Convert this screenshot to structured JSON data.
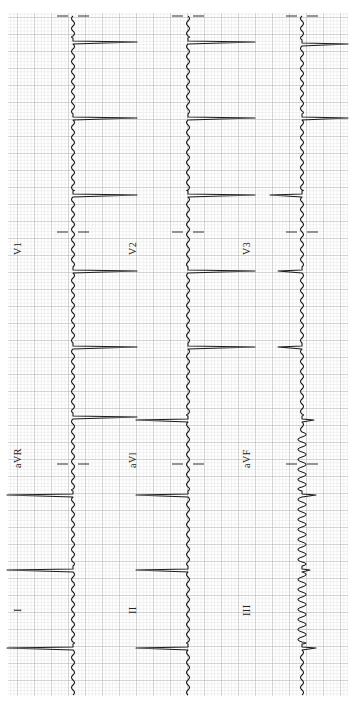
{
  "chart_data": {
    "type": "line",
    "orientation": "rotated-90-ccw",
    "grid": {
      "on": true,
      "minor_px": 3.4,
      "major_px": 17,
      "minor_color": "#d4d4d4",
      "major_color": "#a8a8a8",
      "x0": 8,
      "y0": 13,
      "x1": 348,
      "y1": 696
    },
    "trace_color": "#1a1a1a",
    "rows": [
      {
        "baseline_x": 73,
        "leads": [
          {
            "name": "I",
            "label": "I",
            "label_pos": [
              12,
              598
            ]
          },
          {
            "name": "aVR",
            "label": "aVR",
            "label_pos": [
              12,
              453
            ]
          },
          {
            "name": "V1",
            "label": "V1",
            "label_pos": [
              12,
              245
            ]
          }
        ],
        "qrs_y": [
          42,
          118,
          195,
          271,
          347,
          417,
          495,
          570,
          648
        ],
        "qrs_extent": [
          64,
          64,
          64,
          64,
          64,
          64,
          -66,
          -66,
          -66
        ]
      },
      {
        "baseline_x": 188,
        "leads": [
          {
            "name": "II",
            "label": "II",
            "label_pos": [
              127,
              598
            ]
          },
          {
            "name": "aVL",
            "label": "aVl",
            "label_pos": [
              127,
              453
            ]
          },
          {
            "name": "V2",
            "label": "V2",
            "label_pos": [
              127,
              245
            ]
          }
        ],
        "qrs_y": [
          42,
          118,
          195,
          271,
          347,
          420,
          495,
          570,
          648
        ],
        "qrs_extent": [
          67,
          67,
          67,
          67,
          67,
          -52,
          -52,
          -52,
          -52
        ]
      },
      {
        "baseline_x": 302,
        "leads": [
          {
            "name": "III",
            "label": "III",
            "label_pos": [
              241,
              598
            ]
          },
          {
            "name": "aVF",
            "label": "aVF",
            "label_pos": [
              241,
              453
            ]
          },
          {
            "name": "V3",
            "label": "V3",
            "label_pos": [
              241,
              245
            ]
          }
        ],
        "qrs_y": [
          44,
          118,
          195,
          271,
          347,
          420,
          495,
          570,
          648
        ],
        "qrs_extent": [
          46,
          46,
          -32,
          -24,
          -24,
          12,
          14,
          8,
          14
        ]
      }
    ],
    "lead_separators_y": [
      16,
      232,
      464
    ],
    "xlabel": "",
    "ylabel": ""
  },
  "labels": {
    "row1_limb": "I",
    "row1_aug": "aVR",
    "row1_chest": "V1",
    "row2_limb": "II",
    "row2_aug": "aVl",
    "row2_chest": "V2",
    "row3_limb": "III",
    "row3_aug": "aVF",
    "row3_chest": "V3"
  }
}
